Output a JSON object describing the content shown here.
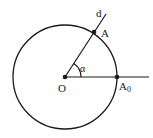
{
  "diagram": {
    "type": "unit-circle-angle",
    "labels": {
      "ray": "d",
      "point_on_circle": "A",
      "angle": "α",
      "center": "O",
      "reference_point": "A",
      "reference_subscript": "0"
    },
    "colors": {
      "stroke": "#1a1a1a",
      "background": "#ffffff"
    }
  }
}
